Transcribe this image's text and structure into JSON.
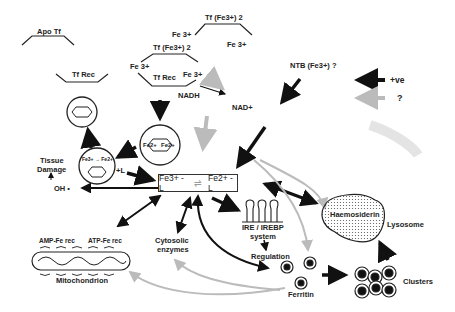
{
  "diagram": {
    "transferrin": {
      "apo_tf": "Apo Tf",
      "tf_rec": "Tf Rec",
      "tf_fe_top": "Tf (Fe3+) 2",
      "tf_fe_mid": "Tf (Fe3+) 2",
      "fe3_a": "Fe 3+",
      "fe3_b": "Fe 3+",
      "fe3_c": "Fe 3+",
      "fe3_d": "Fe 3+",
      "tf_rec_bound": "Tf Rec"
    },
    "redox": {
      "nadh": "NADH",
      "nad": "NAD+",
      "ntb": "NTB (Fe3+) ?"
    },
    "legend": {
      "positive_label": "+ve",
      "unknown_label": "?"
    },
    "endosome": {
      "fe2_left": "Fe2+",
      "fe2_right": "Fe2+",
      "fe_conversion": "Fe3+ → Fe2+"
    },
    "central_pool": {
      "fe3_l": "Fe3+ - L",
      "fe2_l": "Fe2+ - L",
      "plus_l": "+L"
    },
    "damage": {
      "tissue": "Tissue",
      "damage": "Damage",
      "oh": "OH •"
    },
    "mitochondrion": {
      "amp": "AMP-Fe rec",
      "atp": "ATP-Fe rec",
      "label": "Mitochondrion"
    },
    "cytosolic": {
      "line1": "Cytosolic",
      "line2": "enzymes"
    },
    "ire": {
      "line1": "IRE / IREBP",
      "line2": "system",
      "regulation": "Regulation"
    },
    "storage": {
      "ferritin": "Ferritin",
      "clusters": "Clusters",
      "haemosiderin": "Haemosiderin",
      "lysosome": "Lysosome"
    },
    "colors": {
      "black_arrow": "#111111",
      "grey_arrow": "#b8b8b8",
      "ink": "#222222"
    }
  }
}
